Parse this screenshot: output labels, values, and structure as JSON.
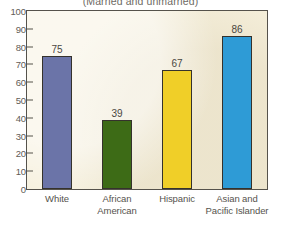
{
  "chart_data": {
    "type": "bar",
    "title": "(Married and unmarried)",
    "xlabel": "",
    "ylabel": "",
    "ylim": [
      0,
      100
    ],
    "ytick_step": 10,
    "yticks": [
      "100",
      "90",
      "80",
      "70",
      "60",
      "50",
      "40",
      "30",
      "20",
      "10",
      "0"
    ],
    "grid": false,
    "legend": "none",
    "categories": [
      "White",
      "African American",
      "Hispanic",
      "Asian and Pacific Islander"
    ],
    "category_lines": [
      [
        "White"
      ],
      [
        "African",
        "American"
      ],
      [
        "Hispanic"
      ],
      [
        "Asian and",
        "Pacific Islander"
      ]
    ],
    "values": [
      75,
      39,
      67,
      86
    ],
    "value_labels": [
      "75",
      "39",
      "67",
      "86"
    ],
    "colors": [
      "#6b74a8",
      "#3d6b16",
      "#f0cf28",
      "#2e9bd6"
    ],
    "plot_background": "#f6f0dc",
    "axis_color": "#55524b",
    "text_color": "#56534d"
  }
}
